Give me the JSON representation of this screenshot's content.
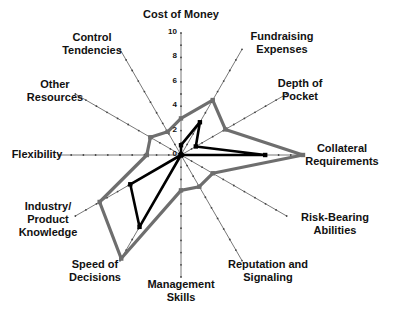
{
  "chart_data": {
    "type": "radar",
    "title": "",
    "axes": [
      "Cost of Money",
      "Fundraising Expenses",
      "Depth of Pocket",
      "Collateral Requirements",
      "Risk-Bearing Abilities",
      "Reputation and Signaling",
      "Management Skills",
      "Speed of Decisions",
      "Industry/ Product Knowledge",
      "Flexibility",
      "Other Resources",
      "Control Tendencies"
    ],
    "axis_labels_display": [
      "Cost of Money",
      "Fundraising\nExpenses",
      "Depth of\nPocket",
      "Collateral\nRequirements",
      "Risk-Bearing\nAbilities",
      "Reputation and\nSignaling",
      "Management\nSkills",
      "Speed of\nDecisions",
      "Industry/\nProduct\nKnowledge",
      "Flexibility",
      "Other\nResources",
      "Control\nTendencies"
    ],
    "radial_ticks": [
      "0",
      "2",
      "4",
      "6",
      "8",
      "10"
    ],
    "rlim": [
      0,
      10
    ],
    "series": [
      {
        "name": "Series A (gray)",
        "color": "#6e6e6e",
        "values": [
          3.0,
          5.2,
          4.2,
          10.0,
          3.0,
          3.0,
          2.9,
          9.8,
          7.7,
          2.8,
          2.9,
          2.2
        ]
      },
      {
        "name": "Series B (black)",
        "color": "#000000",
        "values": [
          0.8,
          3.1,
          1.4,
          6.9,
          0.0,
          0.0,
          0.0,
          6.8,
          4.8,
          0.0,
          0.0,
          0.0
        ]
      }
    ],
    "legend": "none",
    "grid": false
  }
}
